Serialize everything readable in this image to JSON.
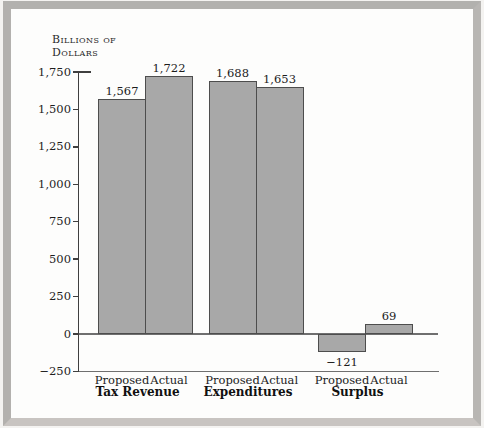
{
  "figure": {
    "ylabel_lines": [
      "Billions of",
      "Dollars"
    ]
  },
  "chart_data": {
    "type": "bar",
    "title": "",
    "ylabel": "Billions of Dollars",
    "ylim": [
      -250,
      1750
    ],
    "y_tick_interval": 250,
    "y_tick_labels": [
      "1,750",
      "1,500",
      "1,250",
      "1,000",
      "750",
      "500",
      "250",
      "0",
      "−250"
    ],
    "categories": [
      "Tax Revenue",
      "Expenditures",
      "Surplus"
    ],
    "series": [
      {
        "name": "Proposed",
        "values": [
          1567,
          1688,
          -121
        ],
        "value_labels": [
          "1,567",
          "1,688",
          "−121"
        ]
      },
      {
        "name": "Actual",
        "values": [
          1722,
          1653,
          69
        ],
        "value_labels": [
          "1,722",
          "1,653",
          "69"
        ]
      }
    ],
    "grid": false,
    "legend": "none",
    "colors": {
      "bar_fill": "#a8a8a8",
      "bar_border": "#4d4d4d",
      "axis": "#3f3f3f",
      "baseline": "#6f6f6f",
      "frame": "#b5b3b0"
    }
  }
}
